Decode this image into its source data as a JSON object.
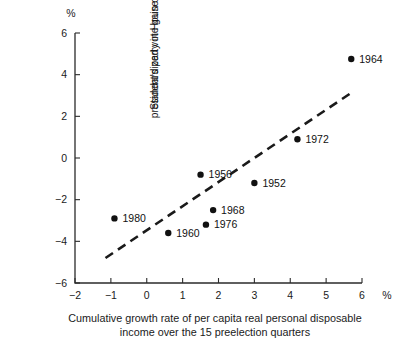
{
  "chart_data": {
    "type": "scatter",
    "title": "",
    "xlabel": "Cumulative growth rate of per capita real personal disposable income over the 15 preelection quarters",
    "xlabel_line1": "Cumulative growth rate of per capita real personal disposable",
    "xlabel_line2": "income over the 15 preelection quarters",
    "ylabel": "Standardized vote gain or loss by the president's party in House elections",
    "ylabel_line1": "Standardized vote gain or loss by the",
    "ylabel_line2": "president's party in House elections",
    "x_unit": "%",
    "y_unit": "%",
    "xlim": [
      -2,
      6
    ],
    "ylim": [
      -6,
      6
    ],
    "xticks": [
      "-2",
      "-1",
      "0",
      "1",
      "2",
      "3",
      "4",
      "5",
      "6"
    ],
    "xtick_values": [
      -2,
      -1,
      0,
      1,
      2,
      3,
      4,
      5,
      6
    ],
    "yticks": [
      "6",
      "4",
      "2",
      "0",
      "-2",
      "-4",
      "-6"
    ],
    "ytick_values": [
      6,
      4,
      2,
      0,
      -2,
      -4,
      -6
    ],
    "grid": false,
    "legend": "none",
    "marker_color": "#111111",
    "axis_color": "#2b2b2b",
    "points": [
      {
        "label": "1964",
        "x": 5.7,
        "y": 4.75,
        "label_side": "right"
      },
      {
        "label": "1972",
        "x": 4.2,
        "y": 0.9,
        "label_side": "right"
      },
      {
        "label": "1952",
        "x": 3.0,
        "y": -1.2,
        "label_side": "right"
      },
      {
        "label": "1956",
        "x": 1.5,
        "y": -0.8,
        "label_side": "right"
      },
      {
        "label": "1968",
        "x": 1.85,
        "y": -2.5,
        "label_side": "right"
      },
      {
        "label": "1976",
        "x": 1.65,
        "y": -3.2,
        "label_side": "right"
      },
      {
        "label": "1960",
        "x": 0.6,
        "y": -3.6,
        "label_side": "right"
      },
      {
        "label": "1980",
        "x": -0.9,
        "y": -2.9,
        "label_side": "right"
      }
    ],
    "trend_line": {
      "style": "dashed",
      "x_start": -1.15,
      "y_start": -4.8,
      "x_end": 5.72,
      "y_end": 3.15
    }
  }
}
